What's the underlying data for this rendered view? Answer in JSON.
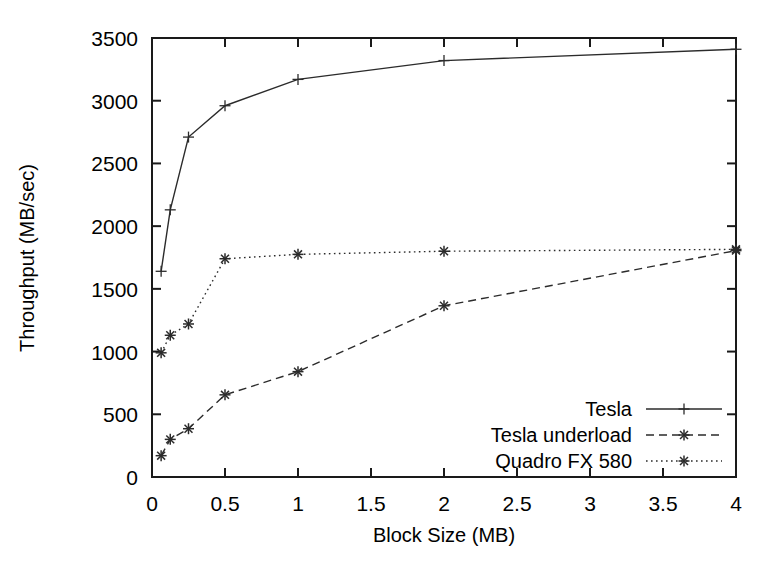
{
  "chart_data": {
    "type": "line",
    "title": "",
    "xlabel": "Block Size (MB)",
    "ylabel": "Throughput (MB/sec)",
    "xlim": [
      0,
      4
    ],
    "ylim": [
      0,
      3500
    ],
    "xticks": [
      "0",
      "0.5",
      "1",
      "1.5",
      "2",
      "2.5",
      "3",
      "3.5",
      "4"
    ],
    "xtick_values": [
      0,
      0.5,
      1,
      1.5,
      2,
      2.5,
      3,
      3.5,
      4
    ],
    "yticks": [
      "0",
      "500",
      "1000",
      "1500",
      "2000",
      "2500",
      "3000",
      "3500"
    ],
    "ytick_values": [
      0,
      500,
      1000,
      1500,
      2000,
      2500,
      3000,
      3500
    ],
    "grid": false,
    "legend_position": "bottom-right",
    "x": [
      0.0625,
      0.125,
      0.25,
      0.5,
      1,
      2,
      4
    ],
    "series": [
      {
        "name": "Tesla",
        "marker": "plus",
        "dash": "none",
        "color": "#2b2b2b",
        "values": [
          1640,
          2130,
          2710,
          2960,
          3170,
          3320,
          3410
        ]
      },
      {
        "name": "Tesla underload",
        "marker": "asterisk",
        "dash": "dashed",
        "color": "#2b2b2b",
        "values": [
          170,
          300,
          385,
          655,
          840,
          1365,
          1805
        ]
      },
      {
        "name": "Quadro FX 580",
        "marker": "asterisk",
        "dash": "dotted",
        "color": "#2b2b2b",
        "values": [
          990,
          1130,
          1220,
          1740,
          1775,
          1800,
          1815
        ]
      }
    ]
  },
  "legend": {
    "entries": [
      {
        "label": "Tesla"
      },
      {
        "label": "Tesla underload"
      },
      {
        "label": "Quadro FX 580"
      }
    ]
  },
  "axes": {
    "x_title": "Block Size (MB)",
    "y_title": "Throughput (MB/sec)"
  }
}
